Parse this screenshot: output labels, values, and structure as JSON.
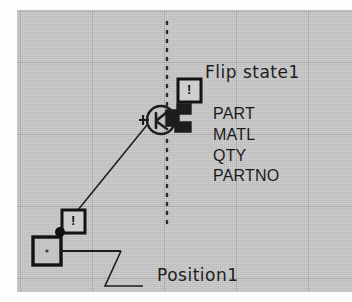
{
  "drawing": {
    "background_color": "#c9c9c9",
    "grid_color": "#b0b0b0",
    "ink_color": "#1d1d1d",
    "canvas": {
      "x": 17,
      "y": 10,
      "width": 335,
      "height": 282
    },
    "grid": {
      "vertical_x": [
        20,
        92,
        164,
        236,
        308
      ],
      "horizontal_y": [
        10,
        62,
        134,
        206,
        278
      ]
    },
    "centerline": {
      "type": "dotted-vertical",
      "x": 150,
      "y_start": 20,
      "y_end": 215
    }
  },
  "annotations": {
    "flip_state": {
      "label": "Flip state1",
      "badge_glyph": "!"
    },
    "position": {
      "label": "Position1"
    }
  },
  "attributes": [
    {
      "name": "PART"
    },
    {
      "name": "MATL"
    },
    {
      "name": "QTY"
    },
    {
      "name": "PARTNO"
    }
  ],
  "symbols": {
    "connector": {
      "name": "circle-arrow-connector",
      "badge_glyph": "!"
    },
    "anchor": {
      "name": "square-handle",
      "badge_glyph": "!"
    }
  },
  "icons": {
    "warning_badge": "!",
    "centerline": "dotted-line",
    "leader": "leader-line"
  }
}
